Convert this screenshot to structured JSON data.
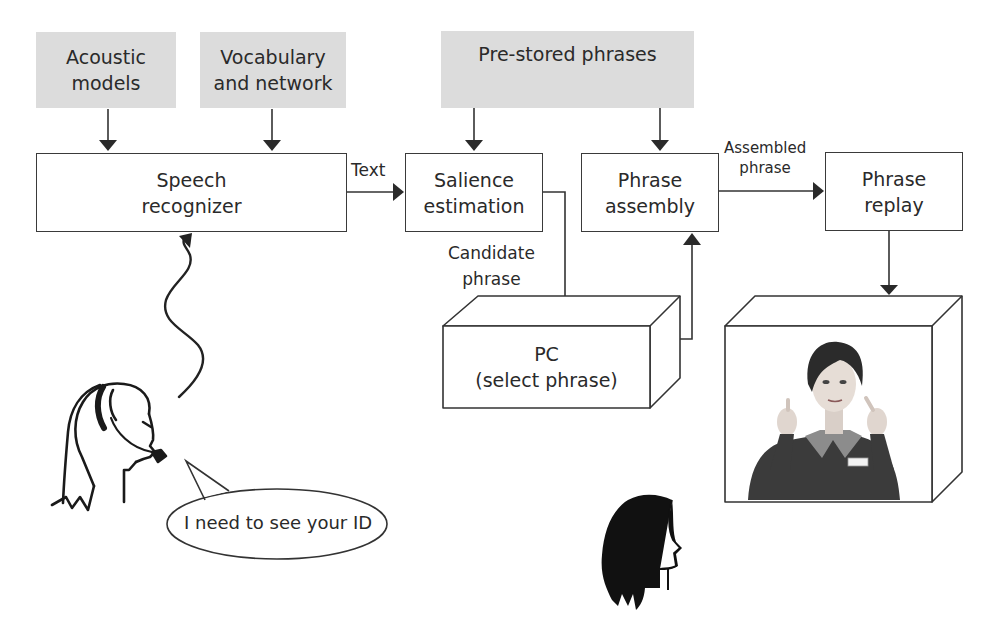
{
  "diagram": {
    "inputs": {
      "acoustic_models": {
        "line1": "Acoustic",
        "line2": "models"
      },
      "vocabulary": {
        "line1": "Vocabulary",
        "line2": "and network"
      },
      "prestored": {
        "label": "Pre-stored phrases"
      }
    },
    "processes": {
      "speech_recognizer": {
        "line1": "Speech",
        "line2": "recognizer"
      },
      "salience": {
        "line1": "Salience",
        "line2": "estimation"
      },
      "assembly": {
        "line1": "Phrase",
        "line2": "assembly"
      },
      "replay": {
        "line1": "Phrase",
        "line2": "replay"
      }
    },
    "devices": {
      "pc": {
        "line1": "PC",
        "line2": "(select phrase)"
      },
      "avatar_screen": {
        "image": "signing-avatar"
      }
    },
    "edge_labels": {
      "text": "Text",
      "candidate": {
        "line1": "Candidate",
        "line2": "phrase"
      },
      "assembled": {
        "line1": "Assembled",
        "line2": "phrase"
      }
    },
    "speech_bubble": "I need to see your ID",
    "colors": {
      "input_fill": "#dcdcdc",
      "stroke": "#3a3a3a",
      "text": "#2a2a2a"
    }
  }
}
